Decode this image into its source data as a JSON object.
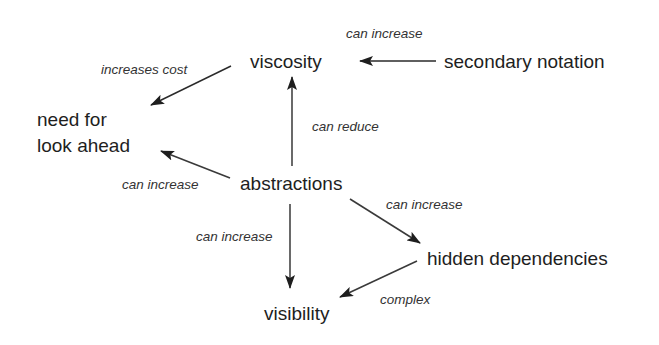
{
  "diagram": {
    "type": "concept-map",
    "nodes": {
      "viscosity": "viscosity",
      "secondary_notation": "secondary notation",
      "look_ahead_line1": "need for",
      "look_ahead_line2": "look ahead",
      "abstractions": "abstractions",
      "hidden_dependencies": "hidden dependencies",
      "visibility": "visibility"
    },
    "edges": [
      {
        "from": "secondary notation",
        "to": "viscosity",
        "label": "can increase"
      },
      {
        "from": "viscosity",
        "to": "need for look ahead",
        "label": "increases cost"
      },
      {
        "from": "abstractions",
        "to": "viscosity",
        "label": "can reduce"
      },
      {
        "from": "abstractions",
        "to": "need for look ahead",
        "label": "can increase"
      },
      {
        "from": "abstractions",
        "to": "visibility",
        "label": "can increase"
      },
      {
        "from": "abstractions",
        "to": "hidden dependencies",
        "label": "can increase"
      },
      {
        "from": "hidden dependencies",
        "to": "visibility",
        "label": "complex"
      }
    ],
    "labels": {
      "secondary_to_viscosity": "can increase",
      "viscosity_to_lookahead": "increases cost",
      "abstractions_to_viscosity": "can reduce",
      "abstractions_to_lookahead": "can increase",
      "abstractions_to_visibility": "can increase",
      "abstractions_to_hidden": "can increase",
      "hidden_to_visibility": "complex"
    },
    "colors": {
      "background": "#ffffff",
      "text": "#1e1e1e",
      "arrow": "#2a2a2a"
    }
  }
}
